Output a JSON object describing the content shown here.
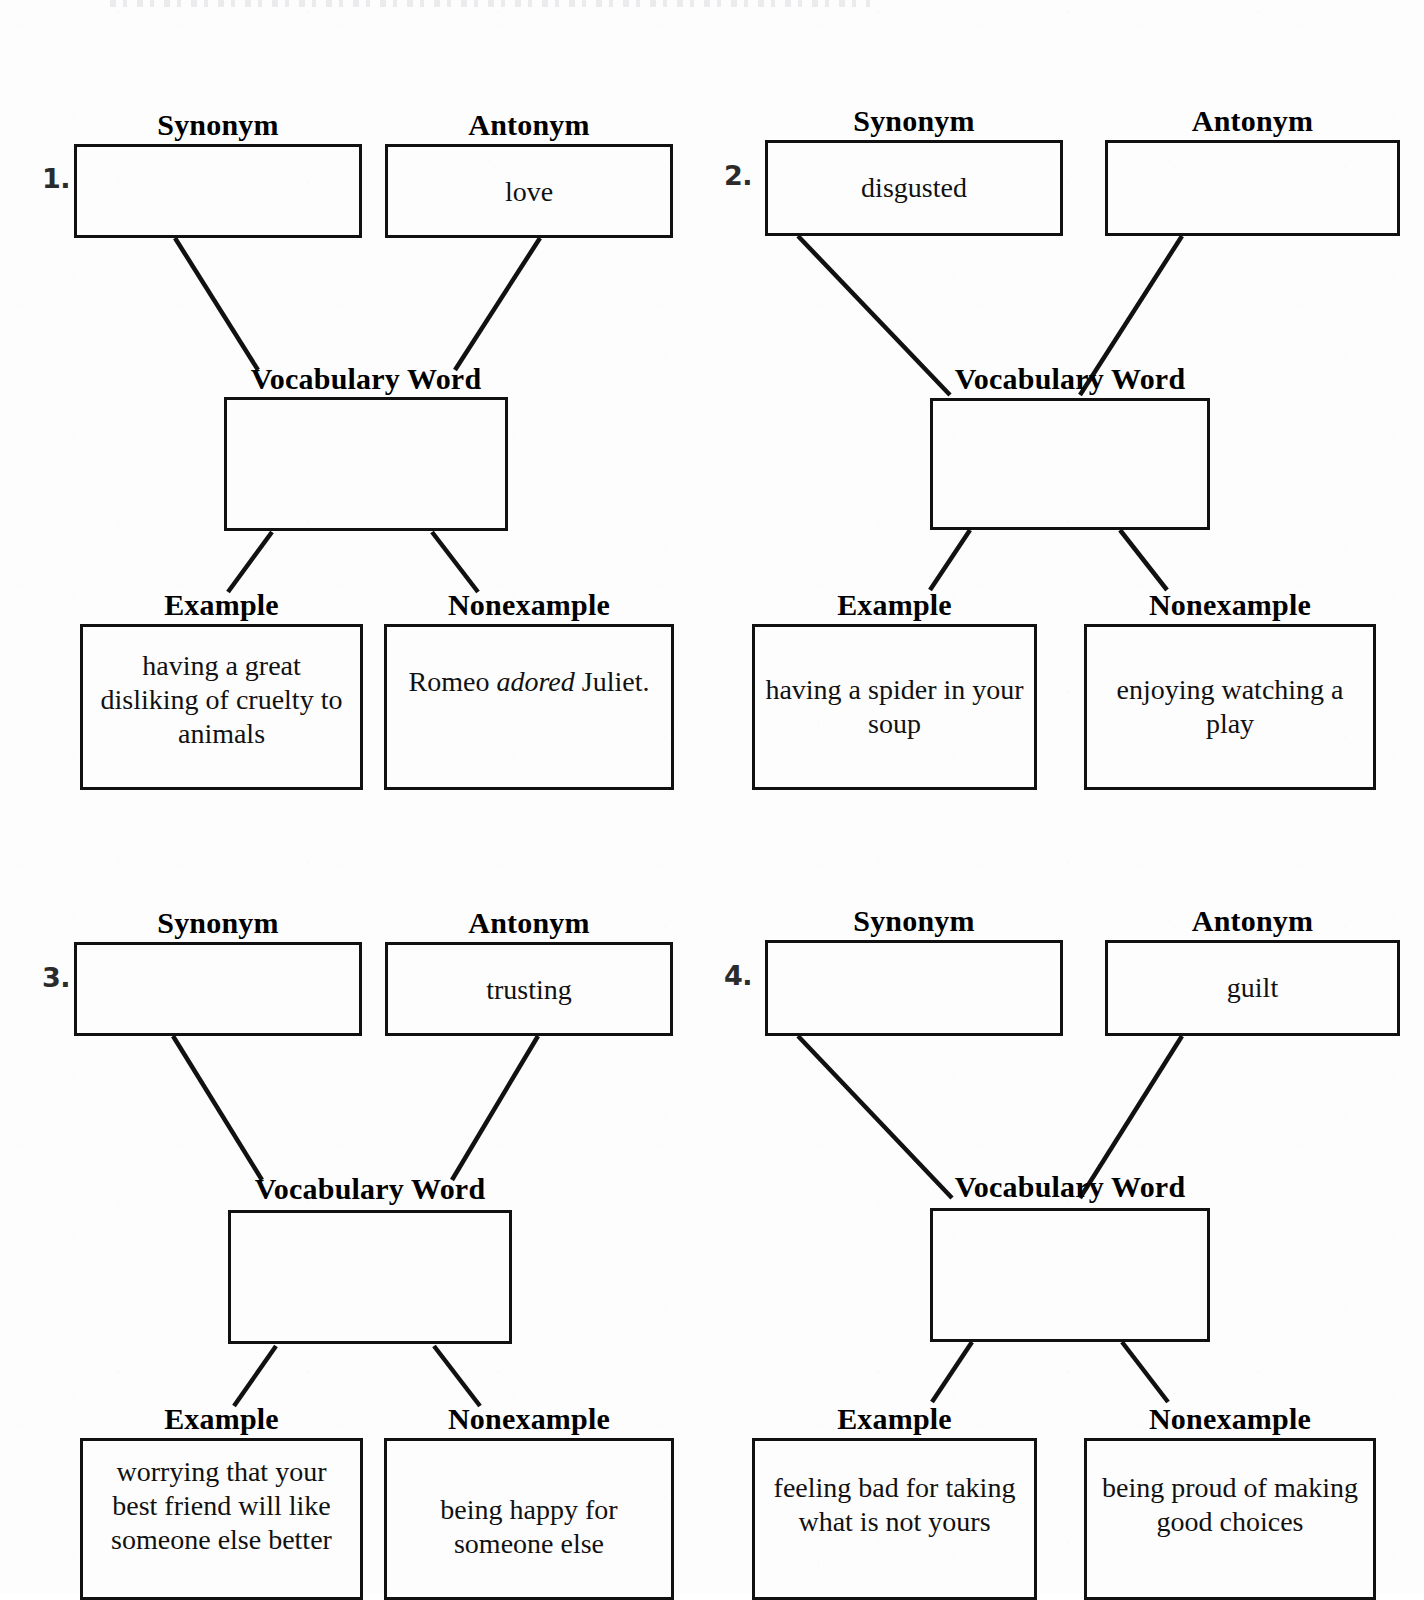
{
  "worksheet": {
    "labels": {
      "synonym": "Synonym",
      "antonym": "Antonym",
      "vocabulary_word": "Vocabulary Word",
      "example": "Example",
      "nonexample": "Nonexample"
    },
    "items": [
      {
        "number": "1.",
        "synonym": "",
        "antonym": "love",
        "vocabulary_word": "",
        "example": "having a great disliking of cruelty to animals",
        "nonexample_prefix": "Romeo ",
        "nonexample_italic": "adored",
        "nonexample_suffix": " Juliet."
      },
      {
        "number": "2.",
        "synonym": "disgusted",
        "antonym": "",
        "vocabulary_word": "",
        "example": "having a spider in your soup",
        "nonexample": "enjoying watching a play"
      },
      {
        "number": "3.",
        "synonym": "",
        "antonym": "trusting",
        "vocabulary_word": "",
        "example": "worrying that your best friend will like someone else better",
        "nonexample": "being happy for someone else"
      },
      {
        "number": "4.",
        "synonym": "",
        "antonym": "guilt",
        "vocabulary_word": "",
        "example": "feeling bad for taking what is not yours",
        "nonexample": "being proud of making good choices"
      }
    ]
  },
  "colors": {
    "ink": "#111111",
    "number_ink": "#2b2b2b",
    "paper": "#fdfdfd"
  }
}
